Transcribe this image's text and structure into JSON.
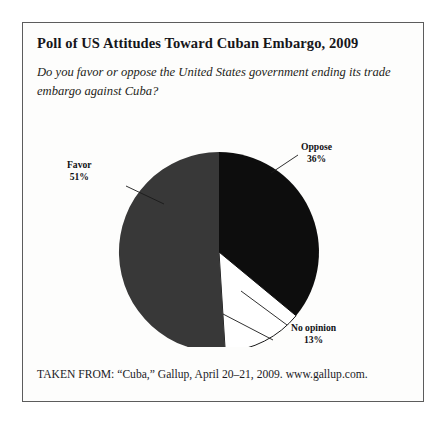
{
  "figure": {
    "title": "Poll of US Attitudes Toward Cuban Embargo, 2009",
    "question": "Do you favor or oppose the United States government ending its trade embargo against Cuba?",
    "source": "TAKEN FROM: “Cuba,” Gallup, April 20–21, 2009. www.gallup.com."
  },
  "labels": {
    "favor_name": "Favor",
    "favor_pct": "51%",
    "oppose_name": "Oppose",
    "oppose_pct": "36%",
    "noopinion_name": "No opinion",
    "noopinion_pct": "13%"
  },
  "colors": {
    "favor": "#383838",
    "oppose": "#0d0d0d",
    "noopinion": "#ffffff",
    "outline": "#1a1a1a",
    "border": "#5c5c5c",
    "text": "#16161a"
  },
  "chart_data": {
    "type": "pie",
    "title": "Poll of US Attitudes Toward Cuban Embargo, 2009",
    "subtitle": "Do you favor or oppose the United States government ending its trade embargo against Cuba?",
    "categories": [
      "Favor",
      "Oppose",
      "No opinion"
    ],
    "values": [
      51,
      36,
      13
    ],
    "unit": "percent",
    "value_labels": [
      "51%",
      "36%",
      "13%"
    ],
    "slice_colors": [
      "#383838",
      "#0d0d0d",
      "#ffffff"
    ],
    "legend": "none",
    "labels_position": "outside-with-leader-lines",
    "start_angle_deg": 90,
    "direction": "counterclockwise",
    "grid": false
  }
}
